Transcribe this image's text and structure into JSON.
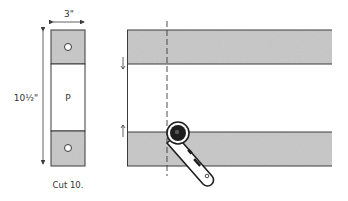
{
  "left_figure": {
    "width_label": "3\"",
    "height_label": "10½\"",
    "center_label": "P",
    "caption": "Cut 10."
  },
  "right_figure": {
    "description": "Folded strip with dashed cutting line and rotary cutter"
  },
  "colors": {
    "line": "#3a3a3a",
    "fabric_fill": "#bdbdbd",
    "cutter_dark": "#1e1e1e"
  }
}
